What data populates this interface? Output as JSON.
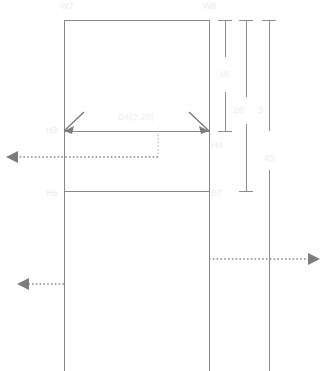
{
  "drawing": {
    "type": "structural-elevation",
    "canvas": {
      "width": 327,
      "height": 371
    },
    "background_color": "#ffffff",
    "line_color": "#888888",
    "dimension_color": "#8d8d8d",
    "label_color": "#ececec",
    "arrow_color": "#7d7d7d"
  },
  "labels": {
    "wall_left": "W7",
    "wall_right": "W8",
    "height_upper": "H3",
    "height_lower": "H4",
    "beam_top": "B4(2.25)",
    "beam_bottom": "B7",
    "room_ref": "R6"
  },
  "dimensions": [
    {
      "id": "dim-18",
      "value": "18",
      "x": 224,
      "y": 74
    },
    {
      "id": "dim-26",
      "value": "26",
      "x": 238,
      "y": 110
    },
    {
      "id": "dim-3",
      "value": "3",
      "x": 261,
      "y": 110
    },
    {
      "id": "dim-45",
      "value": "45",
      "x": 270,
      "y": 158
    }
  ],
  "geometry": {
    "outer_rect": {
      "x": 64,
      "y": 20,
      "width": 145,
      "height": 171
    },
    "mid_line_y": 131,
    "lower_line_y": 191,
    "left_edge_x": 64,
    "right_edge_x": 209,
    "tail_bottom_y": 371,
    "right_column_x": 226
  },
  "annotations": {
    "arrow_mid_left": {
      "label": "",
      "direction": "left",
      "y": 157
    },
    "arrow_lower_left": {
      "label": "",
      "direction": "left",
      "y": 284
    },
    "arrow_right": {
      "label": "",
      "direction": "right",
      "y": 259
    }
  }
}
